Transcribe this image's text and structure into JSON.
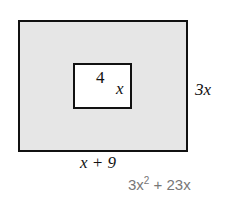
{
  "figure": {
    "inner_label_top": "4",
    "inner_label_side": "x",
    "outer_label_side": "3x",
    "outer_label_bottom": "x + 9",
    "answer": {
      "base": "3x",
      "exp": "2",
      "rest": " + 23x"
    }
  }
}
